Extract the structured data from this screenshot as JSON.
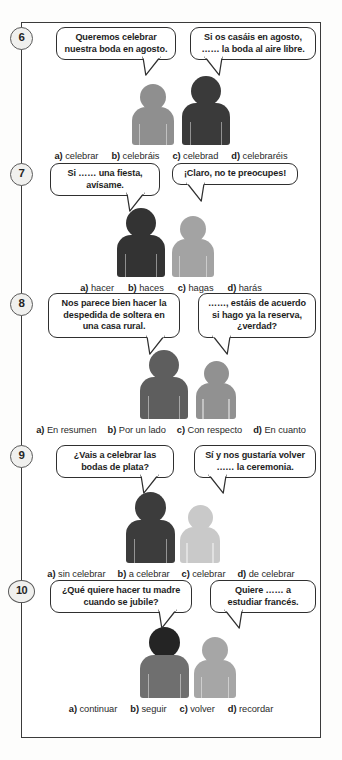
{
  "exercise": {
    "items": [
      {
        "number": "6",
        "bubbles": [
          {
            "lines": [
              "Queremos celebrar",
              "nuestra boda en agosto."
            ],
            "tail": "down-right"
          },
          {
            "lines": [
              "Si os casáis en agosto,",
              "…… la boda al aire libre."
            ],
            "tail": "down-left"
          }
        ],
        "people": [
          {
            "tone": "#8f8f8f"
          },
          {
            "tone": "#3a3a3a"
          }
        ],
        "options": [
          {
            "key": "a)",
            "text": "celebrar"
          },
          {
            "key": "b)",
            "text": "celebráis"
          },
          {
            "key": "c)",
            "text": "celebrad"
          },
          {
            "key": "d)",
            "text": "celebraréis"
          }
        ]
      },
      {
        "number": "7",
        "bubbles": [
          {
            "lines": [
              "Si …… una fiesta,",
              "avísame."
            ],
            "tail": "down-right"
          },
          {
            "lines": [
              "¡Claro, no te preocupes!"
            ],
            "tail": "down-left"
          }
        ],
        "people": [
          {
            "tone": "#333333"
          },
          {
            "tone": "#a3a3a3"
          }
        ],
        "options": [
          {
            "key": "a)",
            "text": "hacer"
          },
          {
            "key": "b)",
            "text": "haces"
          },
          {
            "key": "c)",
            "text": "hagas"
          },
          {
            "key": "d)",
            "text": "harás"
          }
        ]
      },
      {
        "number": "8",
        "bubbles": [
          {
            "lines": [
              "Nos parece bien hacer la",
              "despedida de soltera en",
              "una casa rural."
            ],
            "tail": "down-right"
          },
          {
            "lines": [
              "……, estáis de acuerdo",
              "si hago ya la reserva,",
              "¿verdad?"
            ],
            "tail": "down-left"
          }
        ],
        "people": [
          {
            "tone": "#5e5e5e"
          },
          {
            "tone": "#919191"
          }
        ],
        "options": [
          {
            "key": "a)",
            "text": "En resumen"
          },
          {
            "key": "b)",
            "text": "Por un lado"
          },
          {
            "key": "c)",
            "text": "Con respecto"
          },
          {
            "key": "d)",
            "text": "En cuanto"
          }
        ]
      },
      {
        "number": "9",
        "bubbles": [
          {
            "lines": [
              "¿Vais a celebrar las",
              "bodas de plata?"
            ],
            "tail": "down-right"
          },
          {
            "lines": [
              "Sí y nos gustaría volver",
              "…… la ceremonia."
            ],
            "tail": "down-left"
          }
        ],
        "people": [
          {
            "tone": "#3c3c3c"
          },
          {
            "tone": "#c9c9c9"
          }
        ],
        "options": [
          {
            "key": "a)",
            "text": "sin celebrar"
          },
          {
            "key": "b)",
            "text": "a celebrar"
          },
          {
            "key": "c)",
            "text": "celebrar"
          },
          {
            "key": "d)",
            "text": "de celebrar"
          }
        ]
      },
      {
        "number": "10",
        "bubbles": [
          {
            "lines": [
              "¿Qué quiere hacer tu madre",
              "cuando se jubile?"
            ],
            "tail": "down-right"
          },
          {
            "lines": [
              "Quiere …… a",
              "estudiar francés."
            ],
            "tail": "down-left"
          }
        ],
        "people": [
          {
            "tone": "#6f6f6f",
            "head_tone": "#242424"
          },
          {
            "tone": "#a6a6a6"
          }
        ],
        "options": [
          {
            "key": "a)",
            "text": "continuar"
          },
          {
            "key": "b)",
            "text": "seguir"
          },
          {
            "key": "c)",
            "text": "volver"
          },
          {
            "key": "d)",
            "text": "recordar"
          }
        ]
      }
    ]
  },
  "colors": {
    "frame_border": "#3b3b3b",
    "badge_fill": "#f0f0ee",
    "badge_border": "#5a5a5a",
    "bubble_border": "#2f2f2f",
    "text": "#1d1d1d",
    "page_bg": "#ffffff"
  }
}
